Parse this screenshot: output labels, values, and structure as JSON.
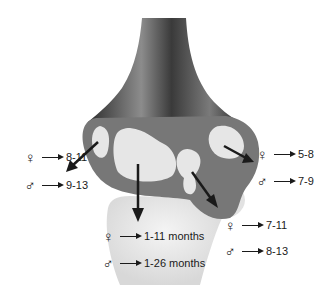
{
  "figure": {
    "colors": {
      "bone_dark": "#3a3a3a",
      "bone_mid": "#6e6e6e",
      "growth_plate": "#8a8a8a",
      "ossification_center": "#e6e6e6",
      "lower_bone": "#ececec",
      "arrow": "#1a1a1a",
      "text": "#1a1a1a"
    },
    "symbols": {
      "female": "♀",
      "male": "♂",
      "arrow_icon": "right-arrow"
    },
    "labels": [
      {
        "id": "left",
        "female_value": "8-11",
        "male_value": "9-13"
      },
      {
        "id": "center",
        "female_value": "1-11 months",
        "male_value": "1-26 months"
      },
      {
        "id": "lower-right",
        "female_value": "7-11",
        "male_value": "8-13"
      },
      {
        "id": "upper-right",
        "female_value": "5-8",
        "male_value": "7-9"
      }
    ]
  }
}
